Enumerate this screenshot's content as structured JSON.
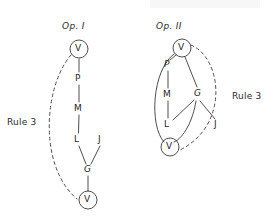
{
  "figure": {
    "background_color": "#ffffff",
    "ink_color": "#2b2b2b",
    "width": 274,
    "height": 220
  },
  "operations": [
    {
      "id": "op-1",
      "title": "Op. I",
      "title_pos": {
        "x": 62,
        "y": 21
      },
      "rule_label": {
        "text": "Rule 3",
        "pos": {
          "x": 7,
          "y": 117
        }
      },
      "nodes": [
        {
          "id": "v-top",
          "label": "V",
          "x": 79,
          "y": 49,
          "circled": true,
          "italic": false
        },
        {
          "id": "p",
          "label": "P",
          "x": 79,
          "y": 79,
          "circled": false,
          "italic": false
        },
        {
          "id": "m",
          "label": "M",
          "x": 79,
          "y": 109,
          "circled": false,
          "italic": false
        },
        {
          "id": "l",
          "label": "L",
          "x": 78,
          "y": 140,
          "circled": false,
          "italic": false
        },
        {
          "id": "j",
          "label": "J",
          "x": 101,
          "y": 140,
          "circled": false,
          "italic": false
        },
        {
          "id": "g",
          "label": "G",
          "x": 88,
          "y": 170,
          "circled": false,
          "italic": true
        },
        {
          "id": "v-bottom",
          "label": "V",
          "x": 88,
          "y": 200,
          "circled": true,
          "italic": false
        }
      ],
      "edges": [
        {
          "from": "v-top",
          "to": "p",
          "style": "solid"
        },
        {
          "from": "p",
          "to": "m",
          "style": "solid"
        },
        {
          "from": "m",
          "to": "l",
          "style": "solid"
        },
        {
          "from": "l",
          "to": "g",
          "style": "solid"
        },
        {
          "from": "j",
          "to": "g",
          "style": "solid"
        },
        {
          "from": "g",
          "to": "v-bottom",
          "style": "solid"
        },
        {
          "from": "v-top",
          "to": "v-bottom",
          "style": "dashed",
          "curve": "left"
        }
      ]
    },
    {
      "id": "op-2",
      "title": "Op. II",
      "title_pos": {
        "x": 156,
        "y": 21
      },
      "rule_label": {
        "text": "Rule 3",
        "pos": {
          "x": 232,
          "y": 91
        }
      },
      "nodes": [
        {
          "id": "v-top",
          "label": "V",
          "x": 182,
          "y": 48,
          "circled": true,
          "italic": false
        },
        {
          "id": "p",
          "label": "P",
          "x": 168,
          "y": 65,
          "circled": false,
          "italic": true
        },
        {
          "id": "m",
          "label": "M",
          "x": 168,
          "y": 95,
          "circled": false,
          "italic": false
        },
        {
          "id": "l",
          "label": "L",
          "x": 168,
          "y": 125,
          "circled": false,
          "italic": false
        },
        {
          "id": "g",
          "label": "G",
          "x": 198,
          "y": 94,
          "circled": false,
          "italic": true
        },
        {
          "id": "j",
          "label": "J",
          "x": 217,
          "y": 125,
          "circled": false,
          "italic": false
        },
        {
          "id": "v-bottom",
          "label": "V",
          "x": 170,
          "y": 147,
          "circled": true,
          "italic": false
        }
      ],
      "edges": [
        {
          "from": "v-top",
          "to": "p",
          "style": "solid"
        },
        {
          "from": "v-top",
          "to": "g",
          "style": "solid"
        },
        {
          "from": "p",
          "to": "m",
          "style": "solid"
        },
        {
          "from": "m",
          "to": "l",
          "style": "solid"
        },
        {
          "from": "g",
          "to": "l",
          "style": "solid"
        },
        {
          "from": "g",
          "to": "j",
          "style": "solid"
        },
        {
          "from": "g",
          "to": "v-bottom",
          "style": "solid",
          "curve": "left"
        },
        {
          "from": "v-top",
          "to": "v-bottom",
          "style": "solid",
          "curve": "left-wide"
        },
        {
          "from": "v-top",
          "to": "v-bottom",
          "style": "dashed",
          "curve": "right"
        }
      ]
    }
  ]
}
